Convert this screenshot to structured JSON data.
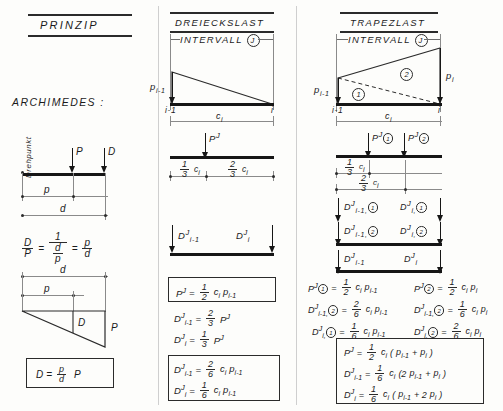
{
  "columns": {
    "left": {
      "title": "PRINZIP",
      "heading": "ARCHIMEDES :"
    },
    "middle": {
      "title": "DREIECKSLAST",
      "interval_label": "INTERVALL",
      "interval_mark": "J"
    },
    "right": {
      "title": "TRAPEZLAST",
      "interval_label": "INTERVALL",
      "interval_mark": "J"
    }
  },
  "left_column": {
    "pivot_label": "Drehpunkt",
    "lever": {
      "force_P": "P",
      "force_D": "D",
      "dim_p": "p",
      "dim_d": "d"
    },
    "ratio_formula": {
      "lhs_num": "D",
      "lhs_den": "P",
      "eq1": "=",
      "mid_num": "1",
      "mid_den_num": "d",
      "mid_den_den": "p",
      "eq2": "=",
      "rhs_num": "p",
      "rhs_den": "d"
    },
    "triangle": {
      "dim_d": "d",
      "dim_p": "p",
      "label_D": "D",
      "label_P": "P"
    },
    "result_box": {
      "lhs": "D",
      "eq": "=",
      "frac_num": "p",
      "frac_den": "d",
      "rhs": "P"
    }
  },
  "middle_column": {
    "load_diagram": {
      "p_left": "p",
      "p_left_sub": "i-1",
      "node_left": "i-1",
      "node_right": "i",
      "span": "c",
      "span_sub": "i"
    },
    "resultant": {
      "label_P": "P",
      "label_P_sup": "J",
      "seg_left_num": "1",
      "seg_left_den": "3",
      "seg_left_c": "c",
      "seg_left_sub": "i",
      "seg_right_num": "2",
      "seg_right_den": "3",
      "seg_right_c": "c",
      "seg_right_sub": "i"
    },
    "reactions": {
      "left": "D",
      "left_sup": "J",
      "left_sub": "i-1",
      "right": "D",
      "right_sup": "J",
      "right_sub": "i"
    },
    "formulas_boxed_top": [
      {
        "lhs": "P",
        "lhs_sup": "J",
        "lhs_sub": "",
        "eq": "=",
        "num": "1",
        "den": "2",
        "tail": "c",
        "tail_sub": "i",
        "tail2": "p",
        "tail2_sub": "i-1"
      }
    ],
    "formulas_plain": [
      {
        "lhs": "D",
        "lhs_sup": "J",
        "lhs_sub": "i-1",
        "eq": "=",
        "num": "2",
        "den": "3",
        "tail": "P",
        "tail_sup": "J"
      },
      {
        "lhs": "D",
        "lhs_sup": "J",
        "lhs_sub": "i",
        "eq": "=",
        "num": "1",
        "den": "3",
        "tail": "P",
        "tail_sup": "J"
      }
    ],
    "formulas_boxed_bottom": [
      {
        "lhs": "D",
        "lhs_sup": "J",
        "lhs_sub": "i-1",
        "eq": "=",
        "num": "2",
        "den": "6",
        "tail": "c",
        "tail_sub": "i",
        "tail2": "p",
        "tail2_sub": "i-1"
      },
      {
        "lhs": "D",
        "lhs_sup": "J",
        "lhs_sub": "i",
        "eq": "=",
        "num": "1",
        "den": "6",
        "tail": "c",
        "tail_sub": "i",
        "tail2": "p",
        "tail2_sub": "i-1"
      }
    ]
  },
  "right_column": {
    "load_diagram": {
      "p_left": "p",
      "p_left_sub": "i-1",
      "p_right": "p",
      "p_right_sub": "i",
      "zone_1": "1",
      "zone_2": "2",
      "node_left": "i-1",
      "node_right": "i",
      "span": "c",
      "span_sub": "i"
    },
    "resultants": {
      "P1": "P",
      "P1_sup": "J",
      "P1_circ": "1",
      "P2": "P",
      "P2_sup": "J",
      "P2_circ": "2",
      "seg_a_num": "1",
      "seg_a_den": "3",
      "seg_a_c": "c",
      "seg_a_sub": "i",
      "seg_b_num": "2",
      "seg_b_den": "3",
      "seg_b_c": "c",
      "seg_b_sub": "i"
    },
    "reaction_rows": [
      {
        "left": "D",
        "left_sup": "J",
        "left_sub": "i-1,",
        "left_circ": "1",
        "right": "D",
        "right_sup": "J",
        "right_sub": "i,",
        "right_circ": "1"
      },
      {
        "left": "D",
        "left_sup": "J",
        "left_sub": "i-1,",
        "left_circ": "2",
        "right": "D",
        "right_sup": "J",
        "right_sub": "i,",
        "right_circ": "2"
      },
      {
        "left": "D",
        "left_sup": "J",
        "left_sub": "i-1",
        "left_circ": "",
        "right": "D",
        "right_sup": "J",
        "right_sub": "i",
        "right_circ": ""
      }
    ],
    "formulas_left": [
      {
        "lhs": "P",
        "lhs_sup": "J",
        "lhs_circ": "1",
        "lhs_sub": "",
        "eq": "=",
        "num": "1",
        "den": "2",
        "t1": "c",
        "t1s": "i",
        "t2": "p",
        "t2s": "i-1"
      },
      {
        "lhs": "D",
        "lhs_sup": "J",
        "lhs_circ": "2",
        "lhs_sub": "i-1,",
        "eq": "=",
        "num": "2",
        "den": "6",
        "t1": "c",
        "t1s": "i",
        "t2": "p",
        "t2s": "i-1"
      },
      {
        "lhs": "D",
        "lhs_sup": "J",
        "lhs_circ": "1",
        "lhs_sub": "i,",
        "eq": "=",
        "num": "1",
        "den": "6",
        "t1": "c",
        "t1s": "i",
        "t2": "p",
        "t2s": "i-1"
      }
    ],
    "formulas_right": [
      {
        "lhs": "P",
        "lhs_sup": "J",
        "lhs_circ": "2",
        "lhs_sub": "",
        "eq": "=",
        "num": "1",
        "den": "2",
        "t1": "c",
        "t1s": "i",
        "t2": "p",
        "t2s": "i"
      },
      {
        "lhs": "D",
        "lhs_sup": "J",
        "lhs_circ": "2",
        "lhs_sub": "i-1,",
        "eq": "=",
        "num": "1",
        "den": "6",
        "t1": "c",
        "t1s": "i",
        "t2": "p",
        "t2s": "i"
      },
      {
        "lhs": "D",
        "lhs_sup": "J",
        "lhs_circ": "2",
        "lhs_sub": "i,",
        "eq": "=",
        "num": "2",
        "den": "6",
        "t1": "c",
        "t1s": "i",
        "t2": "p",
        "t2s": "i"
      }
    ],
    "result_box": [
      {
        "lhs": "P",
        "lhs_sup": "J",
        "lhs_sub": "",
        "eq": "=",
        "num": "1",
        "den": "2",
        "c": "c",
        "c_sub": "i",
        "expr_open": "(",
        "a": "p",
        "a_sub": "i-1",
        "plus": "+",
        "b": "p",
        "b_sub": "i",
        "expr_close": ")"
      },
      {
        "lhs": "D",
        "lhs_sup": "J",
        "lhs_sub": "i-1",
        "eq": "=",
        "num": "1",
        "den": "6",
        "c": "c",
        "c_sub": "i",
        "expr_open": "(2",
        "a": "p",
        "a_sub": "i-1",
        "plus": "+",
        "b": "p",
        "b_sub": "i",
        "expr_close": ")"
      },
      {
        "lhs": "D",
        "lhs_sup": "J",
        "lhs_sub": "i",
        "eq": "=",
        "num": "1",
        "den": "6",
        "c": "c",
        "c_sub": "i",
        "expr_open": "(",
        "a": "p",
        "a_sub": "i-1",
        "plus": "+ 2",
        "b": "p",
        "b_sub": "i",
        "expr_close": ")"
      }
    ]
  }
}
